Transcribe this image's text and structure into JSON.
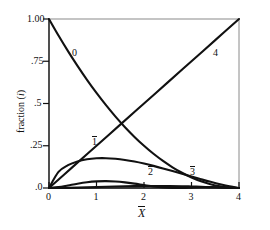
{
  "chart_data": {
    "type": "line",
    "title": "",
    "xlabel": "X̄",
    "ylabel": "fraction (i)",
    "xlim": [
      0,
      4
    ],
    "ylim": [
      0,
      1.0
    ],
    "grid": false,
    "legend_position": "inline-curve-labels",
    "xticks": [
      0,
      1,
      2,
      3,
      4
    ],
    "xticklabels": [
      "0",
      "1",
      "2",
      "3",
      "4"
    ],
    "yticks": [
      0,
      0.25,
      0.5,
      0.75,
      1.0
    ],
    "yticklabels": [
      ".0",
      ".25",
      ".5",
      ".75",
      "1.00"
    ],
    "annotations": [
      {
        "text": "0",
        "x": 0.55,
        "y": 0.8,
        "overbar": false
      },
      {
        "text": "4",
        "x": 3.3,
        "y": 0.8,
        "overbar": false
      },
      {
        "text": "1",
        "x": 1.02,
        "y": 0.255,
        "overbar": true
      },
      {
        "text": "2",
        "x": 2.02,
        "y": 0.105,
        "overbar": true
      },
      {
        "text": "3",
        "x": 2.94,
        "y": 0.105,
        "overbar": true
      }
    ],
    "series": [
      {
        "name": "0",
        "label": "0",
        "overbar": false,
        "color": "#111111",
        "x": [
          0,
          0.2,
          0.4,
          0.6,
          0.8,
          1.0,
          1.2,
          1.4,
          1.6,
          1.8,
          2.0,
          2.2,
          2.4,
          2.6,
          2.8,
          3.0,
          3.2,
          3.4,
          3.6,
          3.8,
          4.0
        ],
        "values": [
          1.0,
          0.9025,
          0.81,
          0.7225,
          0.64,
          0.5625,
          0.49,
          0.4225,
          0.36,
          0.3025,
          0.25,
          0.2025,
          0.16,
          0.1225,
          0.09,
          0.0625,
          0.04,
          0.0225,
          0.01,
          0.0025,
          0.0
        ]
      },
      {
        "name": "1",
        "label": "1̄",
        "overbar": true,
        "color": "#111111",
        "x": [
          0,
          0.2,
          0.4,
          0.6,
          0.8,
          1.0,
          1.2,
          1.4,
          1.6,
          1.8,
          2.0,
          2.2,
          2.4,
          2.6,
          2.8,
          3.0,
          3.2,
          3.4,
          3.6,
          3.8,
          4.0
        ],
        "values": [
          0.0,
          0.095,
          0.135,
          0.1575,
          0.17,
          0.1758,
          0.1764,
          0.1729,
          0.166,
          0.1564,
          0.1445,
          0.1309,
          0.116,
          0.1002,
          0.084,
          0.0677,
          0.0518,
          0.0366,
          0.0224,
          0.0097,
          0.0
        ]
      },
      {
        "name": "2",
        "label": "2̄",
        "overbar": true,
        "color": "#111111",
        "x": [
          0,
          0.2,
          0.4,
          0.6,
          0.8,
          1.0,
          1.2,
          1.4,
          1.6,
          1.8,
          2.0,
          2.2,
          2.4,
          2.6,
          2.8,
          3.0,
          3.2,
          3.4,
          3.6,
          3.8,
          4.0
        ],
        "values": [
          0.0,
          0.005,
          0.015,
          0.0256,
          0.034,
          0.0391,
          0.0405,
          0.0384,
          0.0332,
          0.0259,
          0.0176,
          0.0097,
          0.0038,
          0.0007,
          0.0004,
          0.0022,
          0.0045,
          0.005,
          0.0035,
          0.0012,
          0.0
        ]
      },
      {
        "name": "3",
        "label": "3̄",
        "overbar": true,
        "color": "#111111",
        "x": [
          0,
          0.4,
          0.8,
          1.2,
          1.6,
          2.0,
          2.4,
          2.8,
          3.0,
          3.2,
          3.4,
          3.6,
          3.8,
          4.0
        ],
        "values": [
          0.0,
          0.0008,
          0.0035,
          0.007,
          0.01,
          0.0118,
          0.012,
          0.0103,
          0.009,
          0.0072,
          0.0051,
          0.003,
          0.0011,
          0.0
        ]
      },
      {
        "name": "4",
        "label": "4",
        "overbar": false,
        "color": "#111111",
        "x": [
          0,
          0.5,
          1.0,
          1.5,
          2.0,
          2.5,
          3.0,
          3.5,
          4.0
        ],
        "values": [
          0.0,
          0.125,
          0.25,
          0.375,
          0.5,
          0.625,
          0.75,
          0.875,
          1.0
        ]
      }
    ]
  },
  "axes": {
    "y_title": "fraction (i)",
    "y_title_paren_open": "(",
    "y_title_paren_close": ")",
    "y_title_main": "fraction",
    "y_title_var": "i",
    "x_title_base": "X"
  }
}
